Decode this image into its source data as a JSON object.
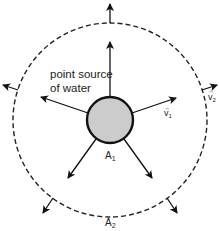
{
  "diagram": {
    "source_label_line1": "point source",
    "source_label_line2": "of water",
    "inner_area_label": "A",
    "inner_area_sub": "1",
    "outer_area_label": "A",
    "outer_area_sub": "2",
    "inner_velocity_label": "v",
    "inner_velocity_sub": "1",
    "outer_velocity_label": "v",
    "outer_velocity_sub": "2",
    "vector_arrow_glyph": "→",
    "colors": {
      "source_fill": "#cccccc",
      "stroke": "#111111",
      "dashed": "#222222"
    },
    "arrow_angles_deg": [
      90,
      18,
      -54,
      -126,
      162
    ]
  }
}
